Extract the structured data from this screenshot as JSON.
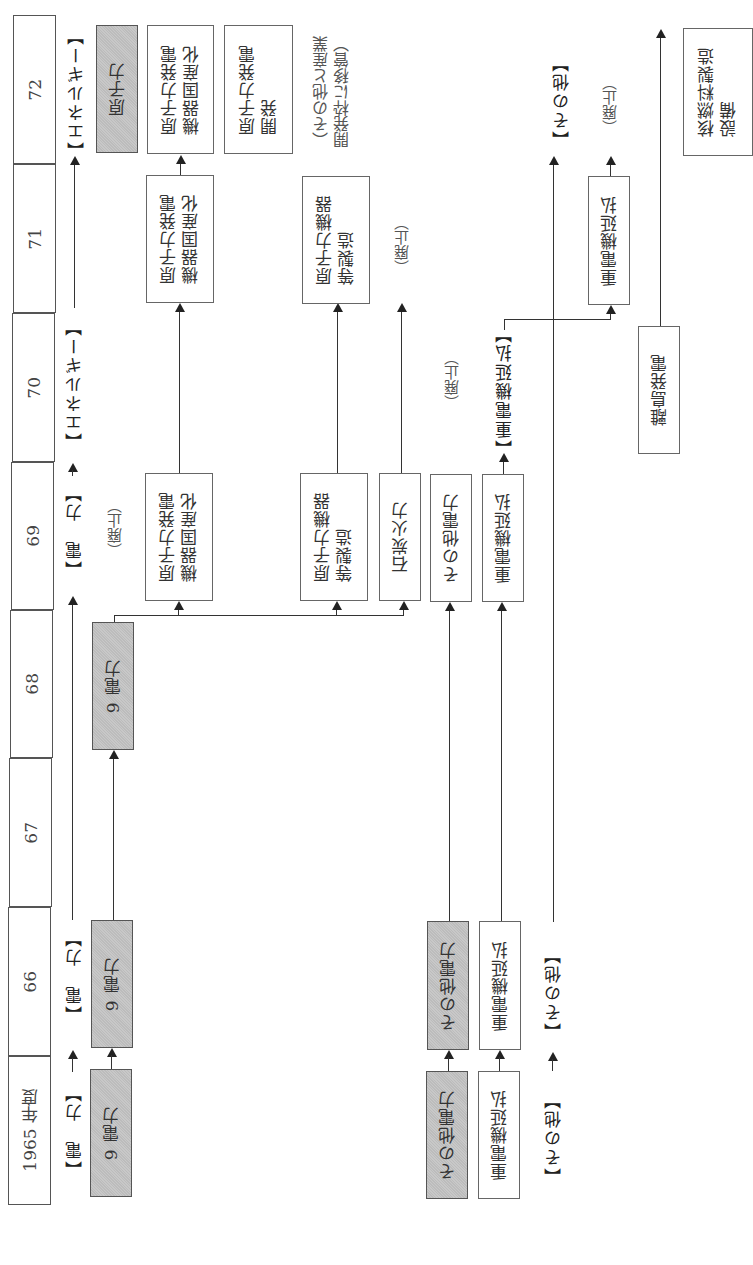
{
  "timeline": {
    "years": [
      {
        "label": "1965 年度"
      },
      {
        "label": "66"
      },
      {
        "label": "67"
      },
      {
        "label": "68"
      },
      {
        "label": "69"
      },
      {
        "label": "70"
      },
      {
        "label": "71"
      },
      {
        "label": "72"
      }
    ]
  },
  "categories": {
    "denryoku_1965": "【電　力】",
    "denryoku_1966": "【電　力】",
    "denryoku_1969": "【電　力】",
    "energy_1970": "【エネルギー】",
    "energy_1972": "【エネルギー】",
    "sonota_1965": "【その他】",
    "sonota_1966": "【その他】",
    "sonota_1972": "【その他】",
    "juudenki_1970": "【重電機延払】"
  },
  "boxes": {
    "kyuu_denryoku_1965": "9 電力",
    "kyuu_denryoku_1966": "9 電力",
    "kyuu_denryoku_1968": "9 電力",
    "genshiryoku_kikikokusan_1969": "原子力発電\n機器国産化",
    "genshiryoku_kiki_seizou_1969": "原子力機器\n等製造",
    "sekitan_karyoku_1969": "石炭火力",
    "sonota_denryoku_1969": "その他電力",
    "juudenki_1969": "重電機延払",
    "genshiryoku_kikikokusan_1971": "原子力発電\n機器国産化",
    "genshiryoku_kiki_seizou_1971": "原子力機器\n等製造",
    "juudenki_1971": "重電機延払",
    "ritou_hatsuden_1970": "離島発電",
    "genshiryoku_1972": "原子力",
    "genshiryoku_kikikokusan_1972": "原子力発電\n機器国産化",
    "genshiryoku_kaihatsu_1972": "原子力発電\n開発",
    "kakunenryou_1972": "核燃料製造\n設備",
    "sonota_denryoku_1965": "その他電力",
    "sonota_denryoku_1966": "その他電力",
    "juudenki_1965": "重電機延払",
    "juudenki_1966": "重電機延払"
  },
  "notes": {
    "haishi_1969": "（廃止）",
    "haishi_sekitan": "（廃止）",
    "haishi_sonota": "（廃止）",
    "haishi_juudenki": "（廃止）",
    "iki_1972": "（その他と産業\n開発枠に移管）"
  },
  "colors": {
    "shaded_box": "#c2c2c2",
    "line": "#333333",
    "border": "#666666"
  }
}
